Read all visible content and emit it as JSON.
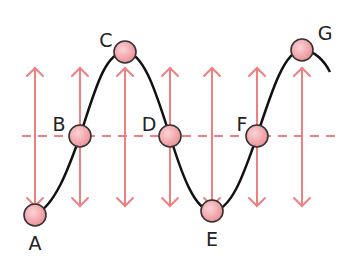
{
  "diagram": {
    "title": "",
    "colors": {
      "arrow": "#f08080",
      "midline": "#f08080",
      "curve": "#111111",
      "point_fill": "#f4a3a8",
      "point_stroke": "#333333"
    },
    "points": [
      {
        "label": "A",
        "x": 35,
        "y": 215,
        "lx": 35,
        "ly": 250
      },
      {
        "label": "B",
        "x": 80,
        "y": 136,
        "lx": 59,
        "ly": 131
      },
      {
        "label": "C",
        "x": 125,
        "y": 52,
        "lx": 106,
        "ly": 47
      },
      {
        "label": "D",
        "x": 170,
        "y": 136,
        "lx": 149,
        "ly": 131
      },
      {
        "label": "E",
        "x": 212,
        "y": 211,
        "lx": 212,
        "ly": 246
      },
      {
        "label": "F",
        "x": 257,
        "y": 136,
        "lx": 242,
        "ly": 131
      },
      {
        "label": "G",
        "x": 302,
        "y": 50,
        "lx": 325,
        "ly": 40
      }
    ],
    "arrows_x": [
      35,
      80,
      125,
      170,
      212,
      257,
      302
    ],
    "arrow_top": 68,
    "arrow_bottom": 206,
    "midline_y": 136
  }
}
